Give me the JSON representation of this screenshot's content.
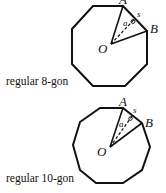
{
  "figures": [
    {
      "id": "octagon",
      "caption": "regular 8-gon",
      "vertex_label_A": "A",
      "vertex_label_B": "B",
      "center_label": "O",
      "apothem_label": "a",
      "side_label": "s",
      "sides": 8
    },
    {
      "id": "decagon",
      "caption": "regular 10-gon",
      "vertex_label_A": "A",
      "vertex_label_B": "B",
      "center_label": "O",
      "apothem_label": "a",
      "side_label": "s",
      "sides": 10
    }
  ],
  "colors": {
    "stroke": "#111111",
    "background": "#ffffff"
  }
}
